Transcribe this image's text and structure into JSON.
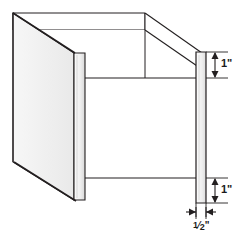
{
  "figure": {
    "type": "technical-line-drawing",
    "background_color": "#ffffff",
    "line_color": "#231f20",
    "panel_fill_light": "#f2f2f2",
    "panel_fill_mid": "#e6e6e6",
    "panel_fill_edge": "#d9d9d9"
  },
  "dimensions": {
    "top_height": "1\"",
    "bottom_height": "1\"",
    "thickness_whole": "",
    "thickness_numerator": "1",
    "thickness_denominator": "2",
    "thickness_unit": "\"",
    "thickness_full": "1/2\""
  },
  "parts": {
    "left_panel_name": "left-side-panel",
    "back_panel_name": "back-panel",
    "right_post_name": "right-vertical-post",
    "floor_name": "floor-panel"
  },
  "annotations": {
    "top_dim_name": "dimension-top-1-inch",
    "bottom_dim_name": "dimension-bottom-1-inch",
    "thickness_dim_name": "dimension-thickness-half-inch"
  }
}
